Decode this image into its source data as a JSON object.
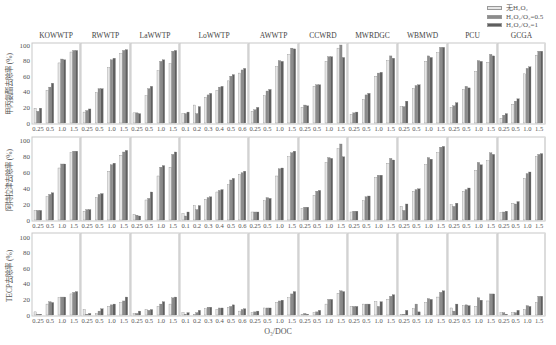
{
  "legend": [
    {
      "label": "无H₂O₂",
      "color": "#e6e6e6"
    },
    {
      "label": "H₂O₂/O₃=0.5",
      "color": "#8c8c8c"
    },
    {
      "label": "H₂O₂/O₃=1",
      "color": "#5e5e5e"
    }
  ],
  "xlabel": "O₃/DOC",
  "chart_data": {
    "type": "bar",
    "title": "",
    "xlabel": "O₃/DOC",
    "ylim": [
      0,
      100
    ],
    "yticks": [
      0,
      20,
      40,
      60,
      80,
      100
    ],
    "grid": false,
    "legend_position": "top-right",
    "series_names": [
      "无H₂O₂",
      "H₂O₂/O₃=0.5",
      "H₂O₂/O₃=1"
    ],
    "rows": [
      {
        "ylabel": "甲丙氨酯去除率 (%)"
      },
      {
        "ylabel": "阿特拉津去除率 (%)"
      },
      {
        "ylabel": "TECP去除率 (%)"
      }
    ],
    "panels": [
      {
        "name": "KOWWTP",
        "categories": [
          "0.25",
          "0.5",
          "1.0",
          "1.5"
        ],
        "values": [
          [
            [
              19,
              15,
              19
            ],
            [
              42,
              46,
              51
            ],
            [
              77,
              82,
              81
            ],
            [
              91,
              93,
              93
            ]
          ],
          [
            [
              12,
              12,
              12
            ],
            [
              29,
              32,
              34
            ],
            [
              65,
              70,
              70
            ],
            [
              84,
              86,
              86
            ]
          ],
          [
            [
              4,
              1,
              1
            ],
            [
              14,
              17,
              16
            ],
            [
              22,
              23,
              23
            ],
            [
              27,
              29,
              30
            ]
          ]
        ]
      },
      {
        "name": "RWWTP",
        "categories": [
          "0.25",
          "0.5",
          "1.0",
          "1.5"
        ],
        "values": [
          [
            [
              14,
              16,
              18
            ],
            [
              39,
              44,
              44
            ],
            [
              71,
              81,
              83
            ],
            [
              89,
              93,
              94
            ]
          ],
          [
            [
              11,
              13,
              13
            ],
            [
              28,
              32,
              33
            ],
            [
              61,
              69,
              71
            ],
            [
              81,
              85,
              87
            ]
          ],
          [
            [
              7,
              1,
              2
            ],
            [
              2,
              5,
              8
            ],
            [
              11,
              13,
              14
            ],
            [
              16,
              18,
              23
            ]
          ]
        ]
      },
      {
        "name": "LaWWTP",
        "categories": [
          "0.25",
          "0.5",
          "1.0",
          "1.5"
        ],
        "values": [
          [
            [
              13,
              13,
              12
            ],
            [
              35,
              44,
              47
            ],
            [
              67,
              79,
              81
            ],
            [
              76,
              92,
              93
            ]
          ],
          [
            [
              7,
              6,
              5
            ],
            [
              25,
              27,
              35
            ],
            [
              55,
              66,
              68
            ],
            [
              66,
              82,
              85
            ]
          ],
          [
            [
              2,
              2,
              5
            ],
            [
              7,
              6,
              7
            ],
            [
              11,
              14,
              17
            ],
            [
              14,
              22,
              23
            ]
          ]
        ]
      },
      {
        "name": "LoWWTP",
        "categories": [
          "0.1",
          "0.2",
          "0.3",
          "0.4",
          "0.5",
          "0.6"
        ],
        "values": [
          [
            [
              12,
              12,
              14
            ],
            [
              23,
              12,
              21
            ],
            [
              33,
              36,
              38
            ],
            [
              42,
              46,
              47
            ],
            [
              54,
              60,
              62
            ],
            [
              64,
              68,
              70
            ]
          ],
          [
            [
              8,
              5,
              10
            ],
            [
              18,
              13,
              18
            ],
            [
              26,
              28,
              29
            ],
            [
              35,
              37,
              38
            ],
            [
              44,
              50,
              52
            ],
            [
              57,
              59,
              61
            ]
          ],
          [
            [
              3,
              1,
              3
            ],
            [
              1,
              3,
              6
            ],
            [
              8,
              10,
              10
            ],
            [
              7,
              9,
              9
            ],
            [
              10,
              11,
              13
            ],
            [
              5,
              7,
              8
            ]
          ]
        ]
      },
      {
        "name": "AWWTP",
        "categories": [
          "0.25",
          "0.5",
          "1.0",
          "1.5"
        ],
        "values": [
          [
            [
              15,
              17,
              20
            ],
            [
              35,
              41,
              43
            ],
            [
              72,
              80,
              79
            ],
            [
              88,
              96,
              95
            ]
          ],
          [
            [
              10,
              10,
              10
            ],
            [
              24,
              28,
              27
            ],
            [
              55,
              64,
              65
            ],
            [
              79,
              84,
              86
            ]
          ],
          [
            [
              3,
              4,
              5
            ],
            [
              9,
              9,
              9
            ],
            [
              16,
              18,
              19
            ],
            [
              22,
              27,
              30
            ]
          ]
        ]
      },
      {
        "name": "CCWRD",
        "categories": [
          "0.25",
          "0.5",
          "1.0",
          "1.5"
        ],
        "values": [
          [
            [
              20,
              23,
              22
            ],
            [
              47,
              49,
              49
            ],
            [
              79,
              85,
              85
            ],
            [
              96,
              100,
              84
            ]
          ],
          [
            [
              14,
              16,
              16
            ],
            [
              31,
              36,
              37
            ],
            [
              72,
              78,
              77
            ],
            [
              89,
              95,
              79
            ]
          ],
          [
            [
              1,
              2,
              1
            ],
            [
              3,
              4,
              6
            ],
            [
              14,
              20,
              20
            ],
            [
              28,
              31,
              30
            ]
          ]
        ]
      },
      {
        "name": "MWRDGC",
        "categories": [
          "0.25",
          "0.5",
          "1.0",
          "1.5"
        ],
        "values": [
          [
            [
              11,
              13,
              14
            ],
            [
              30,
              36,
              38
            ],
            [
              60,
              64,
              65
            ],
            [
              80,
              86,
              83
            ]
          ],
          [
            [
              10,
              11,
              11
            ],
            [
              24,
              29,
              30
            ],
            [
              53,
              56,
              56
            ],
            [
              71,
              77,
              75
            ]
          ],
          [
            [
              11,
              11,
              11
            ],
            [
              14,
              14,
              14
            ],
            [
              17,
              11,
              17
            ],
            [
              20,
              24,
              26
            ]
          ]
        ]
      },
      {
        "name": "WBMWD",
        "categories": [
          "0.25",
          "0.5",
          "1.0",
          "1.5"
        ],
        "values": [
          [
            [
              21,
              21,
              28
            ],
            [
              44,
              48,
              49
            ],
            [
              79,
              86,
              84
            ],
            [
              90,
              97,
              97
            ]
          ],
          [
            [
              17,
              12,
              20
            ],
            [
              36,
              38,
              39
            ],
            [
              69,
              78,
              76
            ],
            [
              84,
              91,
              92
            ]
          ],
          [
            [
              1,
              1,
              6
            ],
            [
              8,
              14,
              4
            ],
            [
              16,
              21,
              20
            ],
            [
              23,
              29,
              31
            ]
          ]
        ]
      },
      {
        "name": "PCU",
        "categories": [
          "0.25",
          "0.5",
          "1.0",
          "1.5"
        ],
        "values": [
          [
            [
              20,
              22,
              26
            ],
            [
              43,
              47,
              45
            ],
            [
              66,
              80,
              79
            ],
            [
              78,
              88,
              86
            ]
          ],
          [
            [
              19,
              17,
              21
            ],
            [
              36,
              38,
              40
            ],
            [
              62,
              72,
              69
            ],
            [
              74,
              84,
              82
            ]
          ],
          [
            [
              9,
              5,
              14
            ],
            [
              12,
              13,
              12
            ],
            [
              11,
              22,
              19
            ],
            [
              18,
              27,
              27
            ]
          ]
        ]
      },
      {
        "name": "GCGA",
        "categories": [
          "0.25",
          "0.5",
          "1.0",
          "1.5"
        ],
        "values": [
          [
            [
              6,
              10,
              12
            ],
            [
              24,
              28,
              31
            ],
            [
              63,
              70,
              72
            ],
            [
              87,
              92,
              92
            ]
          ],
          [
            [
              9,
              10,
              11
            ],
            [
              21,
              20,
              23
            ],
            [
              52,
              58,
              60
            ],
            [
              79,
              82,
              83
            ]
          ],
          [
            [
              3,
              3,
              1
            ],
            [
              3,
              3,
              6
            ],
            [
              7,
              12,
              11
            ],
            [
              16,
              24,
              24
            ]
          ]
        ]
      }
    ]
  }
}
